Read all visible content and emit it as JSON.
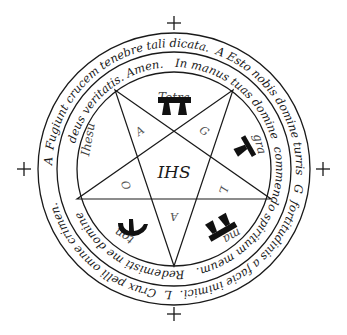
{
  "diagram": {
    "type": "inverted pentagram seal with two concentric circular inscriptions",
    "center_monogram": "IHS",
    "outer_inscription": {
      "text_top_right": "A Esto nobis domine turris",
      "mark_right": "G",
      "text_right_bottom": "fortitudinis a facie inimici.",
      "mark_bottom": "L",
      "text_bottom_left": "Crux pelli omne crimen.",
      "mark_left": "A",
      "text_left_top": "Fugiunt crucem tenebre tali dicata."
    },
    "inner_inscription": {
      "text_top_right": "In manus tuas domine",
      "text_right_bottom": "commendo spiritum meum.",
      "text_bottom_left": "Redemisti me domine",
      "text_left_top": "deus veritatis. Amen."
    },
    "pentagram_point_letters": [
      "A",
      "G",
      "L",
      "A",
      "O"
    ],
    "divine_name_segments": [
      "Tetra",
      "gra",
      "ma",
      "ton",
      "Ihesu"
    ],
    "crosses": [
      "top",
      "right",
      "bottom",
      "left"
    ],
    "glyph_symbols": [
      "tau-double-glyph",
      "tau-rotated-glyph",
      "tau-double-rotated-glyph",
      "trident-glyph"
    ]
  }
}
